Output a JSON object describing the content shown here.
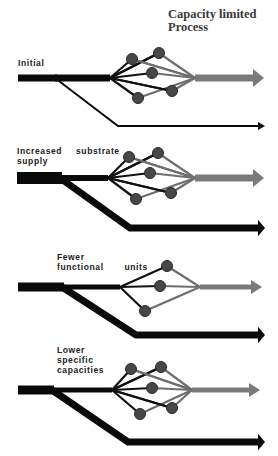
{
  "title": {
    "line1": "Capacity limited",
    "line2": "Process"
  },
  "colors": {
    "background": "#ffffff",
    "input_flow": "#0a0a0a",
    "output_flow": "#7a7a7a",
    "node_fill": "#474747",
    "text": "#222222"
  },
  "panels": [
    {
      "id": "initial",
      "label_lines": [
        "Initial"
      ],
      "label_pos": [
        18,
        58
      ],
      "main_y": 78,
      "bar_start_x": 18,
      "bar_left_thickness": 7,
      "bar_thickness": 7,
      "split_x": 55,
      "diverge_x": 110,
      "converge_x": 195,
      "arrow_end_x": 264,
      "output_thickness": 7,
      "nodes": [
        [
          132,
          59
        ],
        [
          159,
          53
        ],
        [
          152,
          73
        ],
        [
          138,
          98
        ],
        [
          172,
          91
        ]
      ],
      "bypass": {
        "thickness": 2,
        "bend": [
          118,
          126
        ],
        "end_x": 258
      }
    },
    {
      "id": "increased-substrate-supply",
      "label_lines": [
        "Increased  substrate",
        "supply"
      ],
      "label_pos": [
        17,
        146
      ],
      "main_y": 178,
      "bar_start_x": 17,
      "bar_left_thickness": 12,
      "bar_thickness": 6,
      "split_x": 60,
      "diverge_x": 108,
      "converge_x": 195,
      "arrow_end_x": 264,
      "output_thickness": 7,
      "nodes": [
        [
          129,
          157
        ],
        [
          158,
          153
        ],
        [
          150,
          173
        ],
        [
          136,
          199
        ],
        [
          171,
          193
        ]
      ],
      "bypass": {
        "thickness": 7,
        "bend": [
          130,
          228
        ],
        "end_x": 258
      }
    },
    {
      "id": "fewer-functional-units",
      "label_lines": [
        "Fewer",
        "functional   units"
      ],
      "label_pos": [
        57,
        252
      ],
      "main_y": 287,
      "bar_start_x": 18,
      "bar_left_thickness": 9,
      "bar_thickness": 5,
      "split_x": 62,
      "diverge_x": 120,
      "converge_x": 200,
      "arrow_end_x": 262,
      "output_thickness": 5,
      "nodes": [
        [
          167,
          266
        ],
        [
          160,
          286
        ],
        [
          145,
          311
        ]
      ],
      "bypass": {
        "thickness": 7,
        "bend": [
          136,
          335
        ],
        "end_x": 258
      }
    },
    {
      "id": "lower-specific-capacities",
      "label_lines": [
        "Lower",
        "specific",
        "capacities"
      ],
      "label_pos": [
        57,
        345
      ],
      "main_y": 390,
      "bar_start_x": 18,
      "bar_left_thickness": 9,
      "bar_thickness": 5,
      "split_x": 52,
      "diverge_x": 112,
      "converge_x": 192,
      "arrow_end_x": 260,
      "output_thickness": 5,
      "nodes": [
        [
          131,
          369
        ],
        [
          161,
          367
        ],
        [
          152,
          388
        ],
        [
          140,
          414
        ],
        [
          172,
          408
        ]
      ],
      "bypass": {
        "thickness": 7,
        "bend": [
          128,
          442
        ],
        "end_x": 258
      }
    }
  ]
}
